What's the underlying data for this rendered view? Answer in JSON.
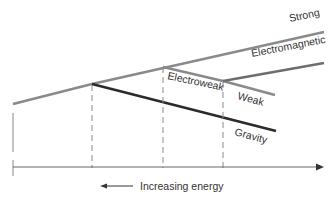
{
  "diagram": {
    "axis": {
      "label": "Increasing energy",
      "direction": "left"
    },
    "forces": [
      {
        "name": "Strong",
        "label": "Strong",
        "color": "#8a8a8a"
      },
      {
        "name": "Electromagnetic",
        "label": "Electromagnetic",
        "color": "#6e6e6e"
      },
      {
        "name": "Electroweak",
        "label": "Electroweak",
        "color": "#8a8a8a"
      },
      {
        "name": "Weak",
        "label": "Weak",
        "color": "#8a8a8a"
      },
      {
        "name": "Gravity",
        "label": "Gravity",
        "color": "#2b2b2b"
      }
    ],
    "colors": {
      "unified_line": "#8a8a8a",
      "gravity_line": "#2b2b2b",
      "dashed": "#8a8a8a",
      "axis": "#666666",
      "text": "#333333"
    }
  }
}
